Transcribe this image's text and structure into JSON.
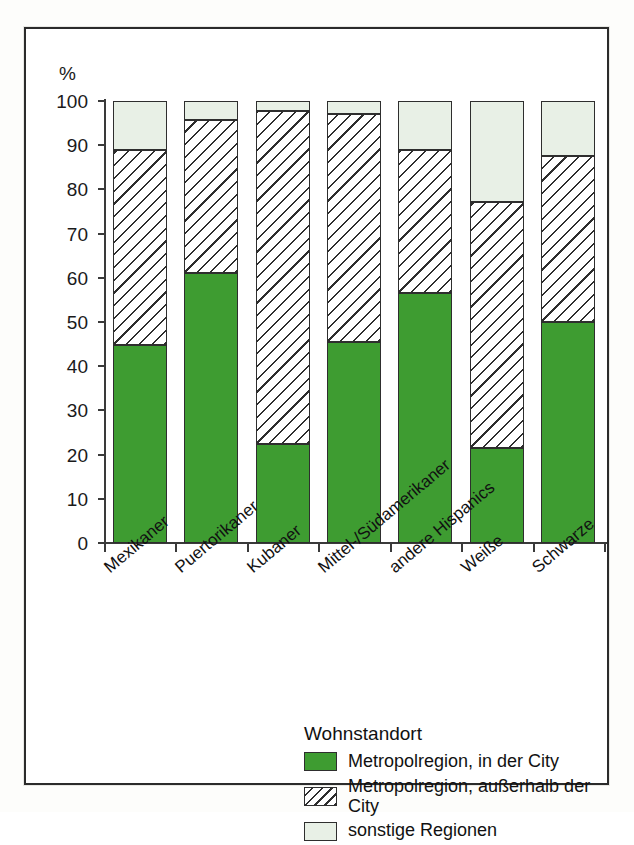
{
  "chart_data": {
    "type": "bar",
    "stacked": true,
    "title": "",
    "subtitle": "",
    "xlabel": "",
    "ylabel": "%",
    "ylim": [
      0,
      100
    ],
    "yticks": [
      0,
      10,
      20,
      30,
      40,
      50,
      60,
      70,
      80,
      90,
      100
    ],
    "grid": false,
    "legend_position": "bottom-center",
    "legend_title": "Wohnstandort",
    "categories": [
      "Mexikaner",
      "Puertorikaner",
      "Kubaner",
      "Mittel-/Südamerikaner",
      "andere Hispanics",
      "Weiße",
      "Schwarze"
    ],
    "series": [
      {
        "name": "Metropolregion, in der City",
        "color": "#3e9c31",
        "values": [
          44.8,
          61.0,
          22.4,
          45.5,
          56.6,
          21.5,
          50.0
        ]
      },
      {
        "name": "Metropolregion, außerhalb der City",
        "color": "#ffffff",
        "pattern": "diagonal-hatch",
        "values": [
          44.2,
          34.6,
          75.4,
          51.5,
          32.3,
          55.7,
          37.5
        ]
      },
      {
        "name": "sonstige Regionen",
        "color": "#e8f0e6",
        "values": [
          11.0,
          4.4,
          2.2,
          3.0,
          11.1,
          22.8,
          12.5
        ]
      }
    ],
    "cumulative_tops": [
      [
        44.8,
        89.0,
        100
      ],
      [
        61.0,
        95.6,
        100
      ],
      [
        22.4,
        97.8,
        100
      ],
      [
        45.5,
        97.0,
        100
      ],
      [
        56.6,
        88.9,
        100
      ],
      [
        21.5,
        77.2,
        100
      ],
      [
        50.0,
        87.5,
        100
      ]
    ]
  },
  "axis": {
    "unit_symbol": "%",
    "tick_labels": [
      "100",
      "90",
      "80",
      "70",
      "60",
      "50",
      "40",
      "30",
      "20",
      "10",
      "0"
    ]
  },
  "legend": {
    "title": "Wohnstandort",
    "items": [
      {
        "label": "Metropolregion, in der City",
        "swatch": "solid-green"
      },
      {
        "label": "Metropolregion, außerhalb der City",
        "swatch": "hatched"
      },
      {
        "label": "sonstige Regionen",
        "swatch": "pale-green"
      }
    ]
  },
  "colors": {
    "city_green": "#3e9c31",
    "other_pale": "#e8f0e6",
    "line": "#2e2e2e",
    "background": "#ffffff"
  }
}
